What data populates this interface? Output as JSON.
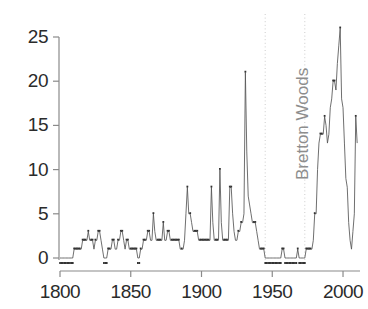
{
  "chart_data": {
    "type": "line",
    "title": "",
    "subtitle": "",
    "xlabel": "",
    "ylabel": "",
    "xlim": [
      1800,
      2012
    ],
    "ylim": [
      0,
      27
    ],
    "grid": false,
    "legend": "none",
    "y_ticks": [
      0,
      5,
      10,
      15,
      20,
      25
    ],
    "y_tick_labels": [
      "0",
      "5",
      "10",
      "15",
      "20",
      "25"
    ],
    "x_ticks": [
      1800,
      1850,
      1900,
      1950,
      2000
    ],
    "x_tick_labels": [
      "1800",
      "1850",
      "1900",
      "1950",
      "2000"
    ],
    "series_name": "Number of countries in default or restructuring",
    "line_color": "#555555",
    "marker_color": "#333333",
    "annotations": [
      {
        "text": "Bretton Woods",
        "orientation": "vertical",
        "color": "#8d8d8d",
        "x_start": 1945,
        "x_end": 1973
      }
    ],
    "vertical_rules": [
      {
        "x": 1945,
        "style": "dotted",
        "color": "#cccccc"
      },
      {
        "x": 1973,
        "style": "dotted",
        "color": "#cccccc"
      }
    ],
    "x": [
      1800,
      1801,
      1802,
      1803,
      1804,
      1805,
      1806,
      1807,
      1808,
      1809,
      1810,
      1811,
      1812,
      1813,
      1814,
      1815,
      1816,
      1817,
      1818,
      1819,
      1820,
      1821,
      1822,
      1823,
      1824,
      1825,
      1826,
      1827,
      1828,
      1829,
      1830,
      1831,
      1832,
      1833,
      1834,
      1835,
      1836,
      1837,
      1838,
      1839,
      1840,
      1841,
      1842,
      1843,
      1844,
      1845,
      1846,
      1847,
      1848,
      1849,
      1850,
      1851,
      1852,
      1853,
      1854,
      1855,
      1856,
      1857,
      1858,
      1859,
      1860,
      1861,
      1862,
      1863,
      1864,
      1865,
      1866,
      1867,
      1868,
      1869,
      1870,
      1871,
      1872,
      1873,
      1874,
      1875,
      1876,
      1877,
      1878,
      1879,
      1880,
      1881,
      1882,
      1883,
      1884,
      1885,
      1886,
      1887,
      1888,
      1889,
      1890,
      1891,
      1892,
      1893,
      1894,
      1895,
      1896,
      1897,
      1898,
      1899,
      1900,
      1901,
      1902,
      1903,
      1904,
      1905,
      1906,
      1907,
      1908,
      1909,
      1910,
      1911,
      1912,
      1913,
      1914,
      1915,
      1916,
      1917,
      1918,
      1919,
      1920,
      1921,
      1922,
      1923,
      1924,
      1925,
      1926,
      1927,
      1928,
      1929,
      1930,
      1931,
      1932,
      1933,
      1934,
      1935,
      1936,
      1937,
      1938,
      1939,
      1940,
      1941,
      1942,
      1943,
      1944,
      1945,
      1946,
      1947,
      1948,
      1949,
      1950,
      1951,
      1952,
      1953,
      1954,
      1955,
      1956,
      1957,
      1958,
      1959,
      1960,
      1961,
      1962,
      1963,
      1964,
      1965,
      1966,
      1967,
      1968,
      1969,
      1970,
      1971,
      1972,
      1973,
      1974,
      1975,
      1976,
      1977,
      1978,
      1979,
      1980,
      1981,
      1982,
      1983,
      1984,
      1985,
      1986,
      1987,
      1988,
      1989,
      1990,
      1991,
      1992,
      1993,
      1994,
      1995,
      1996,
      1997,
      1998,
      1999,
      2000,
      2001,
      2002,
      2003,
      2004,
      2005,
      2006,
      2007,
      2008,
      2009,
      2010
    ],
    "values": [
      0,
      0,
      0,
      0,
      0,
      0,
      0,
      0,
      0,
      0,
      1,
      1,
      1,
      1,
      1,
      1,
      2,
      2,
      2,
      2,
      3,
      2,
      2,
      2,
      1,
      2,
      2,
      3,
      3,
      2,
      1,
      0,
      0,
      0,
      1,
      1,
      1,
      2,
      2,
      1,
      1,
      2,
      2,
      3,
      3,
      2,
      1,
      2,
      2,
      1,
      1,
      1,
      1,
      1,
      1,
      0,
      0,
      1,
      1,
      2,
      2,
      2,
      3,
      3,
      2,
      2,
      5,
      3,
      2,
      2,
      2,
      2,
      2,
      4,
      2,
      2,
      3,
      3,
      2,
      2,
      2,
      2,
      2,
      2,
      2,
      1,
      1,
      1,
      2,
      5,
      8,
      5,
      5,
      4,
      3,
      3,
      3,
      3,
      2,
      2,
      2,
      2,
      2,
      2,
      2,
      2,
      2,
      8,
      4,
      2,
      2,
      2,
      2,
      10,
      4,
      2,
      2,
      2,
      2,
      2,
      8,
      8,
      5,
      3,
      2,
      2,
      3,
      3,
      4,
      4,
      5,
      21,
      12,
      7,
      6,
      5,
      4,
      4,
      4,
      3,
      2,
      1,
      1,
      1,
      1,
      0,
      0,
      0,
      0,
      0,
      0,
      0,
      0,
      0,
      0,
      0,
      0,
      1,
      1,
      0,
      0,
      0,
      0,
      0,
      0,
      0,
      0,
      0,
      1,
      0,
      0,
      0,
      0,
      0,
      1,
      1,
      1,
      1,
      1,
      2,
      5,
      5,
      10,
      13,
      14,
      14,
      14,
      16,
      15,
      13,
      14,
      17,
      18,
      20,
      20,
      19,
      22,
      24,
      26,
      18,
      17,
      13,
      9,
      8,
      4,
      2,
      1,
      3,
      5,
      16,
      13
    ]
  }
}
